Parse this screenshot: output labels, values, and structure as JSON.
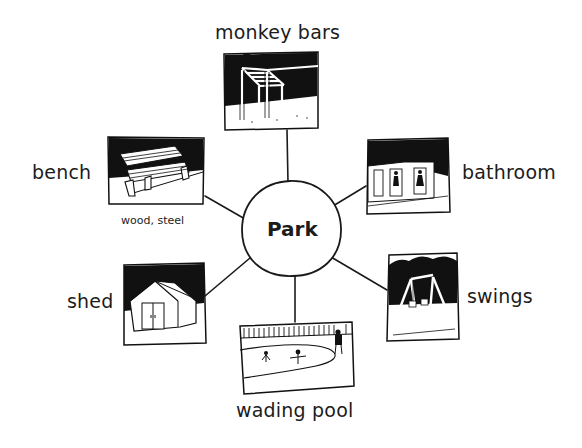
{
  "diagram": {
    "type": "mind-map",
    "center": {
      "label": "Park"
    },
    "nodes": [
      {
        "id": "monkey-bars",
        "label": "monkey bars",
        "illustration": "monkey-bars-sketch"
      },
      {
        "id": "bench",
        "label": "bench",
        "sublabel": "wood, steel",
        "illustration": "bench-sketch"
      },
      {
        "id": "bathroom",
        "label": "bathroom",
        "illustration": "bathroom-sketch"
      },
      {
        "id": "shed",
        "label": "shed",
        "illustration": "shed-sketch"
      },
      {
        "id": "swings",
        "label": "swings",
        "illustration": "swings-sketch"
      },
      {
        "id": "wading-pool",
        "label": "wading pool",
        "illustration": "wading-pool-sketch"
      }
    ]
  },
  "colors": {
    "ink": "#1a1a1a",
    "paper": "#ffffff"
  }
}
